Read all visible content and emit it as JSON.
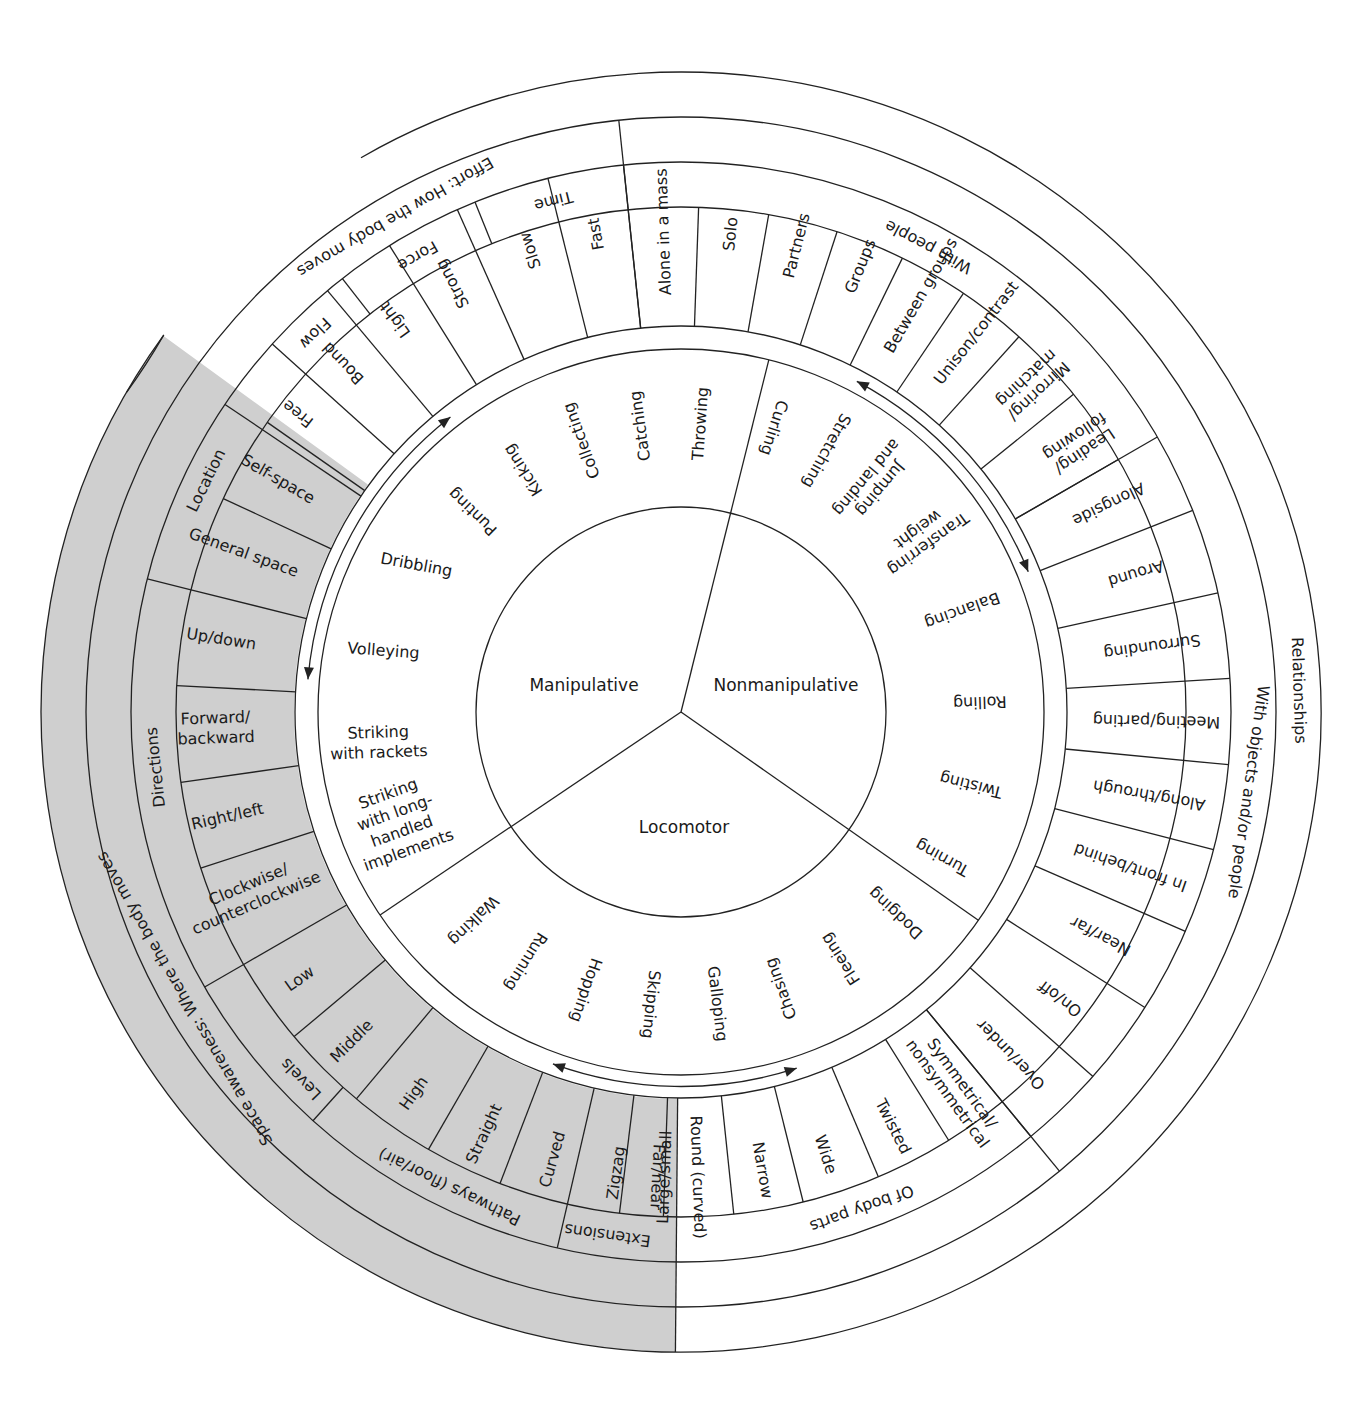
{
  "center_labels": {
    "manipulative": "Manipulative",
    "nonmanipulative": "Nonmanipulative",
    "locomotor": "Locomotor"
  },
  "manipulative_skills": [
    "Throwing",
    "Catching",
    "Collecting",
    "Kicking",
    "Punting",
    "Dribbling",
    "Volleying",
    "Striking with rackets",
    "Striking with long-handled implements"
  ],
  "nonmanipulative_skills": [
    "Curling",
    "Stretching",
    "Jumping and landing",
    "Transferring weight",
    "Balancing",
    "Rolling",
    "Twisting",
    "Turning"
  ],
  "locomotor_skills": [
    "Dodging",
    "Fleeing",
    "Chasing",
    "Galloping",
    "Skipping",
    "Hopping",
    "Running",
    "Walking"
  ],
  "effort": {
    "title": "Effort: How the body moves",
    "groups": [
      {
        "label": "Flow",
        "items": [
          "Free",
          "Bound"
        ]
      },
      {
        "label": "Force",
        "items": [
          "Light",
          "Strong"
        ]
      },
      {
        "label": "Time",
        "items": [
          "Slow",
          "Fast"
        ]
      }
    ]
  },
  "relationships": {
    "title": "Relationships",
    "with_people": {
      "label": "With people",
      "items": [
        "Alone in a mass",
        "Solo",
        "Partners",
        "Groups",
        "Between groups",
        "Unison/contrast",
        "Mirroring/ matching",
        "Leading/ following"
      ]
    },
    "with_objects": {
      "label": "With objects and/or people",
      "items": [
        "Alongside",
        "Around",
        "Surrounding",
        "Meeting/parting",
        "Along/through",
        "In front/behind",
        "Near/far",
        "On/off",
        "Over/under"
      ]
    },
    "body_parts": {
      "label": "Of body parts",
      "items": [
        "Symmetrical/ nonsymmetrical",
        "Twisted",
        "Wide",
        "Narrow",
        "Round (curved)"
      ]
    }
  },
  "space": {
    "title": "Space awareness: Where the body moves",
    "groups": [
      {
        "label": "Location",
        "items": [
          "Self-space",
          "General space"
        ]
      },
      {
        "label": "Directions",
        "items": [
          "Up/down",
          "Forward/ backward",
          "Right/left",
          "Clockwise/ counterclockwise"
        ]
      },
      {
        "label": "Levels",
        "items": [
          "Low",
          "Middle",
          "High"
        ]
      },
      {
        "label": "Pathways (floor/air)",
        "items": [
          "Straight",
          "Curved",
          "Zigzag"
        ]
      },
      {
        "label": "Extensions",
        "items": [
          "Large/small",
          "Far/near"
        ]
      }
    ]
  },
  "colors": {
    "shade": "#cfcfcf",
    "line": "#222222",
    "background": "#ffffff"
  }
}
